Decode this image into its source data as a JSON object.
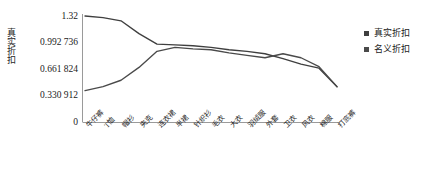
{
  "chart_data": {
    "type": "line",
    "title": "",
    "xlabel": "",
    "ylabel": "真实折扣",
    "ylim": [
      0,
      1.32
    ],
    "grid": false,
    "legend_position": "right",
    "y_ticks": [
      "0",
      "0.330 912",
      "0.661 824",
      "0.992 736",
      "1.32"
    ],
    "y_tick_values": [
      0,
      0.330912,
      0.661824,
      0.992736,
      1.32
    ],
    "categories": [
      "牛仔裤",
      "T恤",
      "帽衫",
      "夹克",
      "连衣裙",
      "半裙",
      "针织衫",
      "毛衣",
      "大衣",
      "羽绒服",
      "外套",
      "卫衣",
      "风衣",
      "棉服",
      "打底裤"
    ],
    "series": [
      {
        "name": "真实折扣",
        "color": "#3f3f3f",
        "values": [
          1.32,
          1.3,
          1.26,
          1.1,
          0.97,
          0.96,
          0.95,
          0.93,
          0.9,
          0.88,
          0.85,
          0.79,
          0.72,
          0.67,
          0.44
        ]
      },
      {
        "name": "名义折扣",
        "color": "#4a4a4a",
        "values": [
          0.39,
          0.44,
          0.52,
          0.68,
          0.88,
          0.93,
          0.91,
          0.9,
          0.86,
          0.83,
          0.8,
          0.85,
          0.8,
          0.69,
          0.44
        ]
      }
    ]
  },
  "axis": {
    "y_title": "真实折扣",
    "line_color": "#9a9a9a"
  },
  "legend": {
    "items": [
      {
        "label": "真实折扣",
        "color": "#3f3f3f",
        "marker": "square-marker"
      },
      {
        "label": "名义折扣",
        "color": "#4a4a4a",
        "marker": "square-marker"
      }
    ]
  }
}
